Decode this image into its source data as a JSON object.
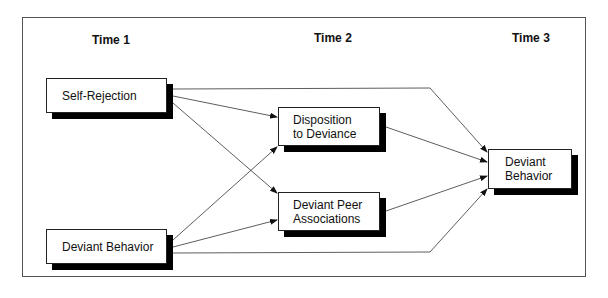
{
  "diagram": {
    "time_labels": [
      "Time 1",
      "Time 2",
      "Time 3"
    ],
    "nodes": {
      "self_rejection": "Self-Rejection",
      "deviant_behavior_t1": "Deviant Behavior",
      "disposition": "Disposition\nto Deviance",
      "peer_associations": "Deviant Peer\nAssociations",
      "deviant_behavior_t3": "Deviant\nBehavior"
    },
    "edges": [
      {
        "from": "Self-Rejection",
        "to": "Disposition to Deviance"
      },
      {
        "from": "Self-Rejection",
        "to": "Deviant Peer Associations"
      },
      {
        "from": "Self-Rejection",
        "to": "Deviant Behavior (Time 3)"
      },
      {
        "from": "Deviant Behavior (Time 1)",
        "to": "Disposition to Deviance"
      },
      {
        "from": "Deviant Behavior (Time 1)",
        "to": "Deviant Peer Associations"
      },
      {
        "from": "Deviant Behavior (Time 1)",
        "to": "Deviant Behavior (Time 3)"
      },
      {
        "from": "Disposition to Deviance",
        "to": "Deviant Behavior (Time 3)"
      },
      {
        "from": "Deviant Peer Associations",
        "to": "Deviant Behavior (Time 3)"
      }
    ]
  }
}
